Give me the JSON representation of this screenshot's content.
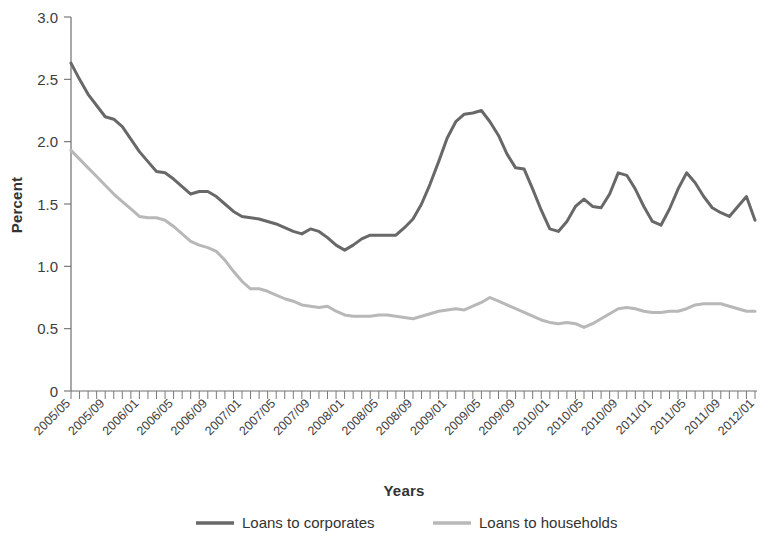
{
  "chart_data": {
    "type": "line",
    "title": "",
    "xlabel": "Years",
    "ylabel": "Percent",
    "ylim": [
      0,
      3.0
    ],
    "ytick_labels": [
      "0",
      "0.5",
      "1.0",
      "1.5",
      "2.0",
      "2.5",
      "3.0"
    ],
    "ytick_values": [
      0,
      0.5,
      1.0,
      1.5,
      2.0,
      2.5,
      3.0
    ],
    "grid": false,
    "legend_position": "bottom",
    "x_start": "2005/05",
    "x_end": "2012/01",
    "x_tick_interval_months": 1,
    "x_label_interval_months": 4,
    "xtick_labels": [
      "2005/05",
      "2005/09",
      "2006/01",
      "2006/05",
      "2006/09",
      "2007/01",
      "2007/05",
      "2007/09",
      "2008/01",
      "2008/05",
      "2008/09",
      "2009/01",
      "2009/05",
      "2009/09",
      "2010/01",
      "2010/05",
      "2010/09",
      "2011/01",
      "2011/05",
      "2011/09",
      "2012/01"
    ],
    "x": [
      "2005/05",
      "2005/06",
      "2005/07",
      "2005/08",
      "2005/09",
      "2005/10",
      "2005/11",
      "2005/12",
      "2006/01",
      "2006/02",
      "2006/03",
      "2006/04",
      "2006/05",
      "2006/06",
      "2006/07",
      "2006/08",
      "2006/09",
      "2006/10",
      "2006/11",
      "2006/12",
      "2007/01",
      "2007/02",
      "2007/03",
      "2007/04",
      "2007/05",
      "2007/06",
      "2007/07",
      "2007/08",
      "2007/09",
      "2007/10",
      "2007/11",
      "2007/12",
      "2008/01",
      "2008/02",
      "2008/03",
      "2008/04",
      "2008/05",
      "2008/06",
      "2008/07",
      "2008/08",
      "2008/09",
      "2008/10",
      "2008/11",
      "2008/12",
      "2009/01",
      "2009/02",
      "2009/03",
      "2009/04",
      "2009/05",
      "2009/06",
      "2009/07",
      "2009/08",
      "2009/09",
      "2009/10",
      "2009/11",
      "2009/12",
      "2010/01",
      "2010/02",
      "2010/03",
      "2010/04",
      "2010/05",
      "2010/06",
      "2010/07",
      "2010/08",
      "2010/09",
      "2010/10",
      "2010/11",
      "2010/12",
      "2011/01",
      "2011/02",
      "2011/03",
      "2011/04",
      "2011/05",
      "2011/06",
      "2011/07",
      "2011/08",
      "2011/09",
      "2011/10",
      "2011/11",
      "2011/12",
      "2012/01"
    ],
    "series": [
      {
        "name": "Loans to corporates",
        "color": "#686868",
        "line_width": 3.0,
        "values": [
          2.63,
          2.5,
          2.38,
          2.29,
          2.2,
          2.18,
          2.12,
          2.02,
          1.92,
          1.84,
          1.76,
          1.75,
          1.7,
          1.64,
          1.58,
          1.6,
          1.6,
          1.56,
          1.5,
          1.44,
          1.4,
          1.39,
          1.38,
          1.36,
          1.34,
          1.31,
          1.28,
          1.26,
          1.3,
          1.28,
          1.23,
          1.17,
          1.13,
          1.17,
          1.22,
          1.25,
          1.25,
          1.25,
          1.25,
          1.31,
          1.38,
          1.5,
          1.66,
          1.84,
          2.03,
          2.16,
          2.22,
          2.23,
          2.25,
          2.16,
          2.05,
          1.9,
          1.79,
          1.78,
          1.62,
          1.45,
          1.3,
          1.28,
          1.36,
          1.48,
          1.54,
          1.48,
          1.47,
          1.58,
          1.75,
          1.73,
          1.62,
          1.48,
          1.36,
          1.33,
          1.46,
          1.62,
          1.75,
          1.67,
          1.56,
          1.47,
          1.43,
          1.4,
          1.48,
          1.56,
          1.37
        ]
      },
      {
        "name": "Loans to households",
        "color": "#b8b8b8",
        "line_width": 3.0,
        "values": [
          1.93,
          1.86,
          1.79,
          1.72,
          1.65,
          1.58,
          1.52,
          1.46,
          1.4,
          1.39,
          1.39,
          1.37,
          1.32,
          1.26,
          1.2,
          1.17,
          1.15,
          1.12,
          1.05,
          0.96,
          0.88,
          0.82,
          0.82,
          0.8,
          0.77,
          0.74,
          0.72,
          0.69,
          0.68,
          0.67,
          0.68,
          0.64,
          0.61,
          0.6,
          0.6,
          0.6,
          0.61,
          0.61,
          0.6,
          0.59,
          0.58,
          0.6,
          0.62,
          0.64,
          0.65,
          0.66,
          0.65,
          0.68,
          0.71,
          0.75,
          0.72,
          0.69,
          0.66,
          0.63,
          0.6,
          0.57,
          0.55,
          0.54,
          0.55,
          0.54,
          0.51,
          0.54,
          0.58,
          0.62,
          0.66,
          0.67,
          0.66,
          0.64,
          0.63,
          0.63,
          0.64,
          0.64,
          0.66,
          0.69,
          0.7,
          0.7,
          0.7,
          0.68,
          0.66,
          0.64,
          0.64
        ]
      }
    ]
  },
  "legend": {
    "items": [
      {
        "label": "Loans to corporates",
        "color": "#686868"
      },
      {
        "label": "Loans to households",
        "color": "#b8b8b8"
      }
    ]
  },
  "axes": {
    "y_title": "Percent",
    "x_title": "Years"
  }
}
